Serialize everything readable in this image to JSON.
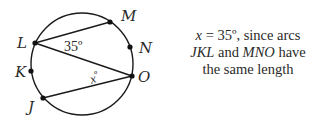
{
  "diagram": {
    "points": {
      "L": "L",
      "M": "M",
      "N": "N",
      "O": "O",
      "K": "K",
      "J": "J"
    },
    "angle_at_L": "35º",
    "angle_at_O": "xº",
    "angle_at_O_var": "x",
    "angle_at_O_deg": "º"
  },
  "caption": {
    "line1_var": "x",
    "line1_rest": " = 35º, since arcs",
    "line2_arc1": "JKL",
    "line2_mid": " and ",
    "line2_arc2": "MNO",
    "line2_rest": " have",
    "line3": "the same length"
  }
}
